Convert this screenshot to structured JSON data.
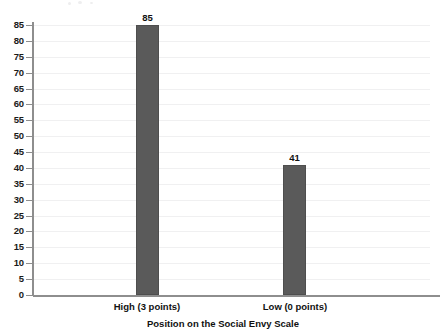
{
  "chart_data": {
    "type": "bar",
    "title": "",
    "subtitle": "",
    "categories": [
      "High (3 points)",
      "Low (0 points)"
    ],
    "values": [
      85,
      41
    ],
    "data_labels": [
      "85",
      "41"
    ],
    "xlabel": "Position on the Social Envy Scale",
    "ylabel": "",
    "ylim": [
      0,
      85
    ],
    "ytick_step": 5,
    "ytick_labels": [
      "85",
      "80",
      "75",
      "70",
      "65",
      "60",
      "55",
      "50",
      "45",
      "40",
      "35",
      "30",
      "25",
      "20",
      "15",
      "10",
      "5",
      "0"
    ],
    "grid": true,
    "grid_axis": "y",
    "legend": false,
    "legend_position": "none",
    "colors": {
      "bar_fill": "#5a5a5a",
      "bar_stroke": "#4e4e4e",
      "axis": "#8e8e8e",
      "grid": "#f0f0f1",
      "text": "#111111",
      "background": "#ffffff"
    }
  }
}
